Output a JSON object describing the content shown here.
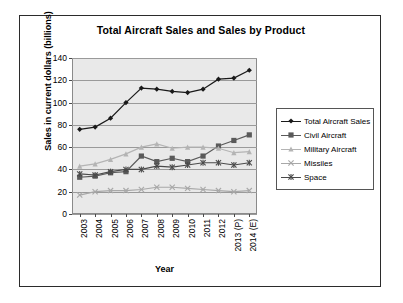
{
  "chart_data": {
    "type": "line",
    "title": "Total Aircraft Sales and Sales by Product",
    "xlabel": "Year",
    "ylabel": "Sales in current dollars (billions)",
    "categories": [
      "2003",
      "2004",
      "2005",
      "2006",
      "2007",
      "2008",
      "2009",
      "2010",
      "2011",
      "2012",
      "2013 (P)",
      "2014 (E)"
    ],
    "yticks": [
      0,
      20,
      40,
      60,
      80,
      100,
      120,
      140
    ],
    "ylim": [
      0,
      140
    ],
    "grid": "horizontal",
    "legend_position": "right",
    "series": [
      {
        "name": "Total Aircraft Sales",
        "marker": "diamond",
        "color": "#1a1a1a",
        "values": [
          76,
          78,
          86,
          100,
          113,
          112,
          110,
          109,
          112,
          121,
          122,
          129
        ]
      },
      {
        "name": "Civil Aircraft",
        "marker": "square",
        "color": "#5a5a5a",
        "values": [
          33,
          34,
          37,
          38,
          52,
          47,
          50,
          47,
          52,
          61,
          66,
          71
        ]
      },
      {
        "name": "Military Aircraft",
        "marker": "triangle",
        "color": "#b4b4b4",
        "values": [
          43,
          45,
          49,
          54,
          60,
          63,
          59,
          60,
          60,
          59,
          55,
          56
        ]
      },
      {
        "name": "Missiles",
        "marker": "cross",
        "color": "#a8a8a8",
        "values": [
          17,
          20,
          21,
          21,
          22,
          24,
          24,
          23,
          22,
          21,
          20,
          21
        ]
      },
      {
        "name": "Space",
        "marker": "asterisk",
        "color": "#4a4a4a",
        "values": [
          36,
          35,
          38,
          40,
          40,
          43,
          42,
          44,
          46,
          46,
          44,
          46
        ]
      }
    ]
  }
}
